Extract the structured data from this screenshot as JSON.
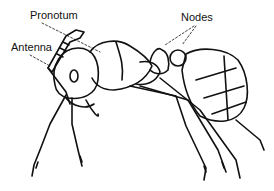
{
  "diagram": {
    "labels": {
      "pronotum": "Pronotum",
      "antenna": "Antenna",
      "nodes": "Nodes"
    },
    "line_color": "#111111",
    "background": "#ffffff"
  }
}
